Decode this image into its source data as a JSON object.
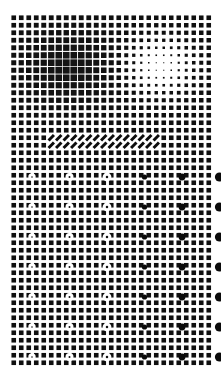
{
  "image": {
    "title": "Textured Grid Perception Stimulus",
    "width": 221,
    "height": 375,
    "background_color": "#ffffff",
    "element_color": "#111111"
  },
  "grid": {
    "name": "square-lattice",
    "origin_x": 10,
    "origin_y": 14,
    "pitch": 7.5,
    "columns": 27,
    "rows": 47,
    "cell_shape": "square",
    "base_square_size": 4.6,
    "line_color": "#ffffff",
    "square_color": "#101010"
  },
  "regions": [
    {
      "name": "dark-gaussian-blob",
      "type": "luminance-blob",
      "polarity": "dark",
      "center_x": 68,
      "center_y": 66,
      "radius_x": 46,
      "radius_y": 36,
      "peak_amplitude": 1.0
    },
    {
      "name": "bright-gaussian-blob",
      "type": "luminance-blob",
      "polarity": "light",
      "center_x": 160,
      "center_y": 66,
      "radius_x": 34,
      "radius_y": 28,
      "peak_amplitude": 1.0
    },
    {
      "name": "diagonal-stripe-band",
      "type": "oriented-texture",
      "orientation_degrees": 45,
      "start_x": 44,
      "end_x": 160,
      "center_y": 141,
      "band_half_height": 9,
      "stripe_count": 16
    },
    {
      "name": "dot-marker-array",
      "type": "marker-grid",
      "first_marker_x": 32,
      "first_marker_y": 177,
      "spacing_x": 37.5,
      "spacing_y": 30,
      "marker_columns": 6,
      "marker_rows": 7,
      "polarity_left": "white",
      "polarity_right": "black",
      "min_radius": 1.3,
      "max_radius": 4.6
    }
  ],
  "chart_data": {
    "type": "heatmap",
    "title": "Textured Grid Perception Stimulus",
    "xlabel": "",
    "ylabel": "",
    "grid": true,
    "legend": "none",
    "columns": 27,
    "rows": 47,
    "marker_radii_by_column": [
      1.3,
      1.6,
      2.0,
      2.6,
      3.4,
      4.6
    ],
    "marker_polarity_by_column": [
      "white",
      "white",
      "white",
      "black",
      "black",
      "black"
    ]
  }
}
